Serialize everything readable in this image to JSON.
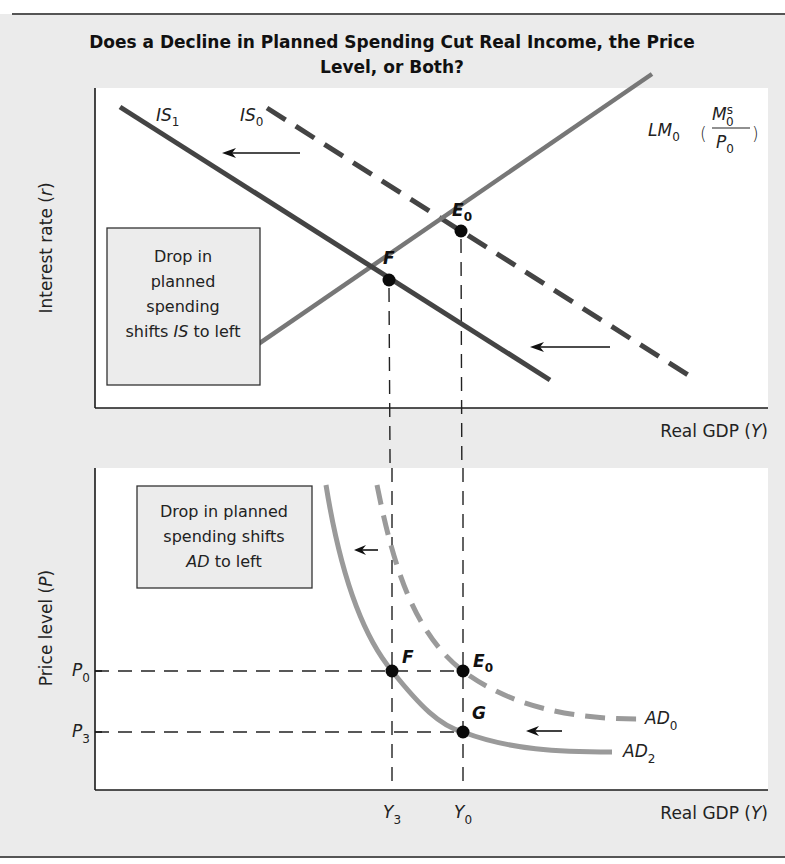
{
  "title": {
    "line1": "Does a Decline in Planned Spending Cut Real Income, the Price",
    "line2": "Level, or Both?"
  },
  "colors": {
    "background_panel": "#ebebeb",
    "plot_area": "#ffffff",
    "is_curves": "#444444",
    "lm_curve": "#777777",
    "ad_curves": "#9a9a9a",
    "points": "#0a0a0a"
  },
  "top_panel": {
    "ylabel_text": "Interest rate (",
    "ylabel_var": "r",
    "ylabel_close": ")",
    "xlabel_text": "Real GDP (",
    "xlabel_var": "Y",
    "xlabel_close": ")",
    "curves": {
      "is1": {
        "name": "IS",
        "sub": "1",
        "style": "solid"
      },
      "is0": {
        "name": "IS",
        "sub": "0",
        "style": "dashed"
      },
      "lm0": {
        "name": "LM",
        "sub": "0",
        "frac_num": "M",
        "frac_num_sup": "s",
        "frac_num_sub": "0",
        "frac_den": "P",
        "frac_den_sub": "0"
      }
    },
    "points": {
      "e0": {
        "name": "E",
        "sub": "0"
      },
      "f": {
        "name": "F"
      }
    },
    "annotation": {
      "line1": "Drop in",
      "line2": "planned",
      "line3": "spending",
      "line4_pre": "shifts ",
      "line4_it": "IS",
      "line4_post": " to left"
    }
  },
  "bottom_panel": {
    "ylabel_text": "Price level (",
    "ylabel_var": "P",
    "ylabel_close": ")",
    "xlabel_text": "Real GDP (",
    "xlabel_var": "Y",
    "xlabel_close": ")",
    "y_ticks": [
      {
        "name": "P",
        "sub": "0"
      },
      {
        "name": "P",
        "sub": "3"
      }
    ],
    "x_ticks": [
      {
        "name": "Y",
        "sub": "3"
      },
      {
        "name": "Y",
        "sub": "0"
      }
    ],
    "curves": {
      "ad0": {
        "name": "AD",
        "sub": "0",
        "style": "dashed"
      },
      "ad2": {
        "name": "AD",
        "sub": "2",
        "style": "solid"
      }
    },
    "points": {
      "f": {
        "name": "F"
      },
      "e0": {
        "name": "E",
        "sub": "0"
      },
      "g": {
        "name": "G"
      }
    },
    "annotation": {
      "line1": "Drop in planned",
      "line2": "spending shifts",
      "line3_it": "AD",
      "line3_post": " to left"
    }
  }
}
